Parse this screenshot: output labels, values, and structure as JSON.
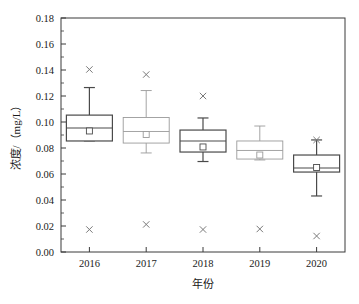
{
  "chart_data": {
    "type": "box",
    "title": "",
    "xlabel": "年份",
    "ylabel": "浓度/（mg/L）",
    "ylim": [
      0.0,
      0.18
    ],
    "yticks": [
      "0.00",
      "0.02",
      "0.04",
      "0.06",
      "0.08",
      "0.10",
      "0.12",
      "0.14",
      "0.16",
      "0.18"
    ],
    "ytick_values": [
      0.0,
      0.02,
      0.04,
      0.06,
      0.08,
      0.1,
      0.12,
      0.14,
      0.16,
      0.18
    ],
    "categories": [
      "2016",
      "2017",
      "2018",
      "2019",
      "2020"
    ],
    "grid": false,
    "legend": "none",
    "colors": {
      "axis": "#3a3a3a",
      "box_dark": "#4a4a4a",
      "box_light": "#9a9a9a",
      "outlier": "#7a7a7a",
      "text": "#1a1a1a"
    },
    "boxes": [
      {
        "category": "2016",
        "whisker_low": 0.0855,
        "q1": 0.0854,
        "median": 0.0954,
        "q3": 0.1053,
        "whisker_high": 0.1265,
        "mean": 0.0931,
        "outliers": [
          0.1404,
          0.0173
        ],
        "shade": "dark"
      },
      {
        "category": "2017",
        "whisker_low": 0.0762,
        "q1": 0.0838,
        "median": 0.0927,
        "q3": 0.1035,
        "whisker_high": 0.1242,
        "mean": 0.0904,
        "outliers": [
          0.1365,
          0.0212
        ],
        "shade": "light"
      },
      {
        "category": "2018",
        "whisker_low": 0.0696,
        "q1": 0.0769,
        "median": 0.0854,
        "q3": 0.0938,
        "whisker_high": 0.1031,
        "mean": 0.0808,
        "outliers": [
          0.12,
          0.0173
        ],
        "shade": "dark"
      },
      {
        "category": "2019",
        "whisker_low": 0.0708,
        "q1": 0.0715,
        "median": 0.0781,
        "q3": 0.0854,
        "whisker_high": 0.0969,
        "mean": 0.0746,
        "outliers": [
          0.0177
        ],
        "shade": "light"
      },
      {
        "category": "2020",
        "whisker_low": 0.0431,
        "q1": 0.0615,
        "median": 0.0646,
        "q3": 0.0746,
        "whisker_high": 0.0862,
        "mean": 0.065,
        "outliers": [
          0.0862,
          0.0123
        ],
        "shade": "dark"
      }
    ]
  }
}
